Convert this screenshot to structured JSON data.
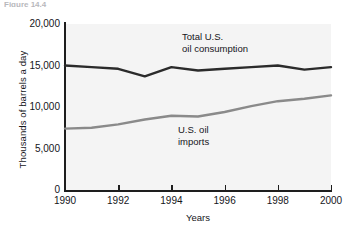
{
  "figure": {
    "caption": "Figure 14.4"
  },
  "chart_data": {
    "type": "line",
    "title": "",
    "xlabel": "Years",
    "ylabel": "Thousands of barrels a day",
    "xlim": [
      1990,
      2000
    ],
    "ylim": [
      0,
      20000
    ],
    "grid": false,
    "legend_position": "inline-annotations",
    "x": [
      1990,
      1991,
      1992,
      1993,
      1994,
      1995,
      1996,
      1997,
      1998,
      1999,
      2000
    ],
    "xticks": [
      "1990",
      "1992",
      "1994",
      "1996",
      "1998",
      "2000"
    ],
    "xtick_values": [
      1990,
      1992,
      1994,
      1996,
      1998,
      2000
    ],
    "yticks": [
      "0",
      "5,000",
      "10,000",
      "15,000",
      "20,000"
    ],
    "ytick_values": [
      0,
      5000,
      10000,
      15000,
      20000
    ],
    "series": [
      {
        "name": "Total U.S. oil consumption",
        "color": "#2b2b2b",
        "annotation": "Total U.S.\noil consumption",
        "values": [
          15000,
          14800,
          14600,
          13700,
          14800,
          14400,
          14600,
          14800,
          15000,
          14500,
          14800
        ]
      },
      {
        "name": "U.S. oil imports",
        "color": "#8a8a8a",
        "annotation": "U.S. oil\nimports",
        "values": [
          7400,
          7500,
          7900,
          8500,
          8950,
          8850,
          9400,
          10100,
          10700,
          11000,
          11400
        ]
      }
    ]
  }
}
